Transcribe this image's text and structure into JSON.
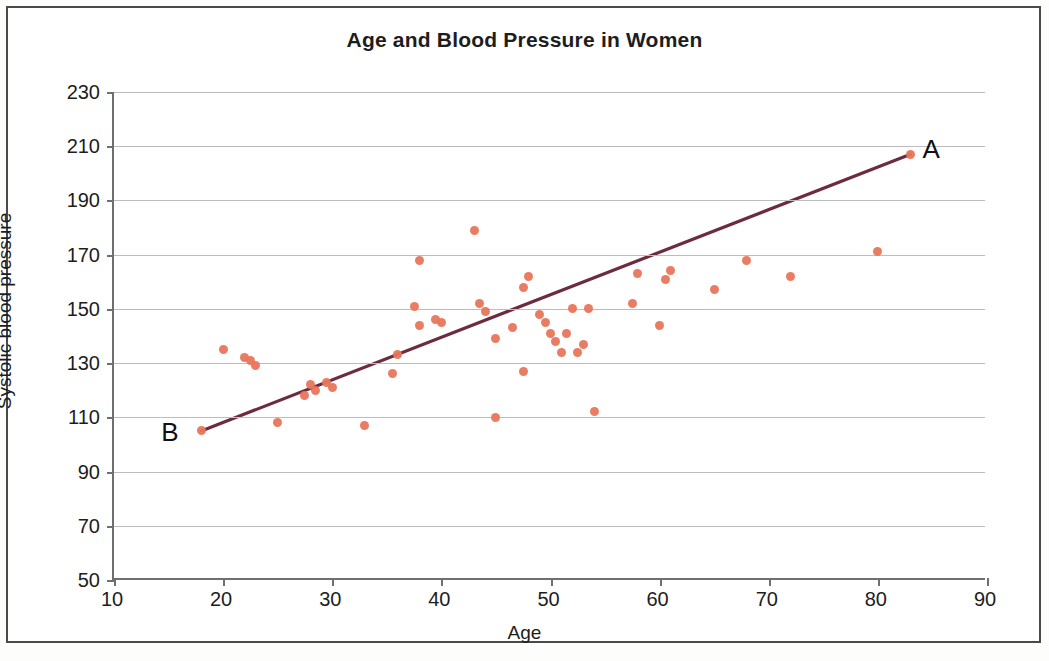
{
  "figure": {
    "border_color": "#4a4a4a",
    "background": "#ffffff"
  },
  "axis": {
    "y_title": "Systolic blood pressure",
    "x_title": "Age"
  },
  "annotations": {
    "a_label": "A",
    "b_label": "B"
  },
  "chart_data": {
    "type": "scatter",
    "title": "Age and Blood Pressure in Women",
    "xlabel": "Age",
    "ylabel": "Systolic blood pressure",
    "xlim": [
      10,
      90
    ],
    "ylim": [
      50,
      230
    ],
    "xticks": [
      10,
      20,
      30,
      40,
      50,
      60,
      70,
      80,
      90
    ],
    "yticks": [
      50,
      70,
      90,
      110,
      130,
      150,
      170,
      190,
      210,
      230
    ],
    "grid": "horizontal",
    "legend": "none",
    "point_color": "#e8765b",
    "trendline_color": "#6e2b3d",
    "series": [
      {
        "name": "Women",
        "x": [
          18,
          20,
          22,
          22.5,
          23,
          25,
          27.5,
          28,
          28.5,
          29.5,
          30,
          33,
          35.5,
          36,
          37.5,
          38,
          38,
          39.5,
          40,
          43,
          43.5,
          44,
          45,
          45,
          46.5,
          47.5,
          47.5,
          48,
          49,
          49.5,
          50,
          50.5,
          51,
          51.5,
          52,
          52.5,
          53,
          53.5,
          54,
          57.5,
          58,
          60,
          60.5,
          61,
          65,
          68,
          72,
          80,
          83
        ],
        "y": [
          105,
          135,
          132,
          131,
          129,
          108,
          118,
          122,
          120,
          123,
          121,
          107,
          126,
          133,
          151,
          168,
          144,
          146,
          145,
          179,
          152,
          149,
          110,
          139,
          143,
          127,
          158,
          162,
          148,
          145,
          141,
          138,
          134,
          141,
          150,
          134,
          137,
          150,
          112,
          152,
          163,
          144,
          161,
          164,
          157,
          168,
          162,
          171,
          207
        ]
      }
    ],
    "trendline": {
      "label_start": "B",
      "label_end": "A",
      "start": [
        18,
        105
      ],
      "end": [
        83,
        207
      ]
    }
  }
}
